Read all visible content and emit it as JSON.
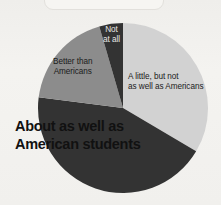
{
  "background_color": "#f2f1ee",
  "chart_data": {
    "type": "pie",
    "title": "",
    "center": [
      123,
      108
    ],
    "radius": 85,
    "start_angle_deg": 0,
    "direction": "clockwise",
    "legend": "none (labels placed on slices)",
    "categories": [
      "A little, but not as well as Americans",
      "About as well as American students",
      "Better than Americans",
      "Not at all"
    ],
    "values": [
      33.5,
      43.5,
      18.5,
      4.5
    ],
    "unit": "percent",
    "colors": [
      "#d2d2d2",
      "#333333",
      "#8c8c8c",
      "#333333"
    ],
    "slices": [
      {
        "label": "A little, but not\nas well as Americans",
        "value": 33.5,
        "color": "#d2d2d2",
        "start_deg": 0,
        "end_deg": 120.6,
        "label_color": "#1b1b1b",
        "label_placement": "inside"
      },
      {
        "label": "About as well as\nAmerican students",
        "value": 43.5,
        "color": "#333333",
        "start_deg": 120.6,
        "end_deg": 277.2,
        "label_color": "#111111",
        "label_placement": "outside-bottom-left",
        "emphasis": "bold"
      },
      {
        "label": "Better than\nAmericans",
        "value": 18.5,
        "color": "#8c8c8c",
        "start_deg": 277.2,
        "end_deg": 343.8,
        "label_color": "#1b1b1b",
        "label_placement": "inside"
      },
      {
        "label": "Not\nat all",
        "value": 4.5,
        "color": "#333333",
        "start_deg": 343.8,
        "end_deg": 360,
        "label_color": "#e9e8e5",
        "label_placement": "inside"
      }
    ]
  },
  "labels": {
    "a_little": "A little, but not\nas well as Americans",
    "about_as_well": "About as well as\nAmerican students",
    "better_than": "Better than\nAmericans",
    "not_at_all": "Not\nat all"
  }
}
